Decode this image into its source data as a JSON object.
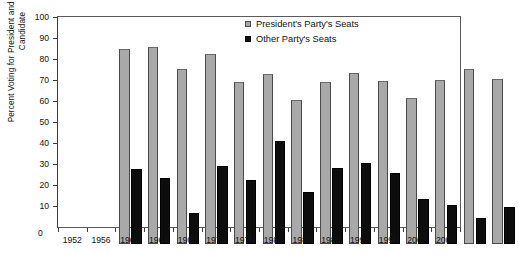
{
  "chart_data": {
    "type": "bar",
    "title": "",
    "xlabel": "",
    "ylabel": "Percent Voting for President and Winning Senate Candidate",
    "ylim": [
      0,
      100
    ],
    "ytick_step": 10,
    "grid": false,
    "legend_position": "top-right",
    "categories": [
      "1952",
      "1956",
      "1960",
      "1964",
      "1968",
      "1972",
      "1976",
      "1980",
      "1984",
      "1988",
      "1992",
      "1996",
      "2000",
      "2004"
    ],
    "yticks": [
      "0",
      "10",
      "20",
      "30",
      "40",
      "50",
      "60",
      "70",
      "80",
      "90",
      "100"
    ],
    "series": [
      {
        "name": "President's Party's Seats",
        "color": "#a9a9a9",
        "values": [
          93,
          94,
          83.5,
          90.5,
          77,
          81,
          68.5,
          77,
          81.5,
          77.5,
          69.5,
          78,
          83.5,
          78.5
        ]
      },
      {
        "name": "Other Party's Seats",
        "color": "#0d0d0d",
        "values": [
          35.5,
          31.5,
          15,
          37,
          30.5,
          49,
          25,
          36,
          38.5,
          34,
          21.5,
          18.5,
          12.5,
          17.5
        ]
      }
    ]
  }
}
